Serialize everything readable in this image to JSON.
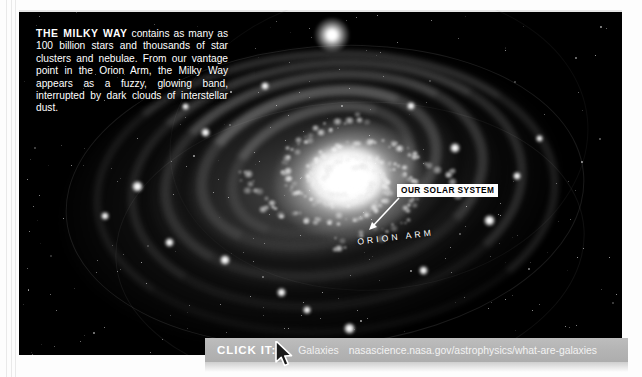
{
  "page": {
    "background_color": "#ffffff",
    "photo_background": "#000000"
  },
  "caption": {
    "lead": "THE MILKY WAY",
    "body": " contains as many as 100 billion stars and thousands of star clusters and nebulae. From our vantage point in the Orion Arm, the Milky Way appears as a fuzzy, glowing band, interrupted by dark clouds of interstellar dust."
  },
  "annotations": {
    "solar_system_label": "OUR SOLAR SYSTEM",
    "orion_arm_label": "ORION ARM"
  },
  "click_bar": {
    "label": "CLICK IT:",
    "link_text": "Galaxies",
    "url": "nasascience.nasa.gov/astrophysics/what-are-galaxies",
    "bar_color": "#b4b4b4",
    "label_color": "#ffffff"
  },
  "cursor": {
    "name": "mouse-pointer"
  }
}
